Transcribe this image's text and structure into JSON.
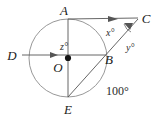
{
  "figure": {
    "type": "geometry-diagram",
    "width": 158,
    "height": 118,
    "background_color": "#ffffff",
    "stroke_color": "#4a4a4a",
    "circle_stroke_color": "#8c8c8c",
    "label_color": "#1b1b1b"
  },
  "circle": {
    "center_label": "O",
    "center_x": 68,
    "center_y": 58,
    "radius": 39,
    "center_dot": true
  },
  "points": [
    {
      "id": "A",
      "label": "A",
      "x": 68,
      "y": 19,
      "label_x": 67,
      "label_y": 14,
      "on_circle": true
    },
    {
      "id": "B",
      "label": "B",
      "x": 105,
      "y": 55,
      "label_x": 109,
      "label_y": 63,
      "on_circle": true
    },
    {
      "id": "C",
      "label": "C",
      "x": 137,
      "y": 18,
      "label_x": 145,
      "label_y": 22,
      "on_circle": false
    },
    {
      "id": "D",
      "label": "D",
      "x": 29,
      "y": 55,
      "label_x": 9,
      "label_y": 59,
      "on_circle": false
    },
    {
      "id": "E",
      "label": "E",
      "x": 68,
      "y": 97,
      "label_x": 66,
      "label_y": 112,
      "on_circle": true
    },
    {
      "id": "O",
      "label": "O",
      "x": 68,
      "y": 58,
      "label_x": 57,
      "label_y": 71,
      "on_circle": false
    }
  ],
  "segments": [
    {
      "id": "AE",
      "from": "A",
      "to": "E",
      "description": "vertical diameter from A to E"
    },
    {
      "id": "DB",
      "from": "D",
      "to": "B",
      "description": "horizontal line from D through O to B"
    },
    {
      "id": "AC",
      "from": "A",
      "to": "C",
      "description": "ray from A to external point C"
    },
    {
      "id": "EC",
      "from": "E",
      "to": "C",
      "description": "secant from E through B to C"
    }
  ],
  "arrows": [
    {
      "id": "arrow-on-DB",
      "on_segment": "DB",
      "tip_x": 58,
      "tip_y": 55,
      "direction": "right"
    },
    {
      "id": "arrow-on-AC",
      "on_segment": "AC",
      "tip_x": 116,
      "tip_y": 21,
      "direction": "right-up"
    },
    {
      "id": "arrow-on-EC",
      "on_segment": "EC",
      "tip_x": 130,
      "tip_y": 24,
      "direction": "right-up"
    }
  ],
  "angle_labels": [
    {
      "id": "z",
      "text": "z°",
      "x": 62,
      "y": 49,
      "italic": true
    },
    {
      "id": "x",
      "text": "x°",
      "x": 109,
      "y": 34,
      "italic": true
    },
    {
      "id": "y",
      "text": "y°",
      "x": 128,
      "y": 49,
      "italic": true
    },
    {
      "id": "arc100",
      "text": "100°",
      "x": 112,
      "y": 93,
      "italic": false
    }
  ],
  "angle_marks": [
    {
      "id": "angle-mark-at-C",
      "description": "small arc mark between rays AC and EC near vertex C"
    }
  ]
}
